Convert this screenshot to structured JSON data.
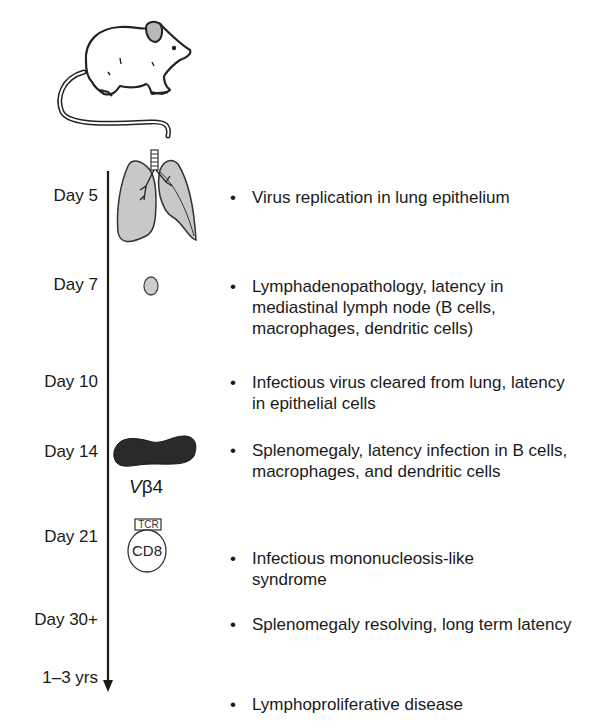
{
  "figure": {
    "timeline": {
      "days": [
        {
          "label": "Day 5",
          "description": "Virus replication in lung epithelium",
          "icon": "lungs-icon"
        },
        {
          "label": "Day 7",
          "description": "Lymphadenopathology, latency in mediastinal lymph node (B cells, macrophages, dendritic cells)",
          "icon": "lymph-node-icon"
        },
        {
          "label": "Day 10",
          "description": "Infectious virus cleared from lung, latency in epithelial cells",
          "icon": null
        },
        {
          "label": "Day 14",
          "description": "Splenomegaly, latency infection in B cells, macrophages, and dendritic cells",
          "icon": "spleen-icon"
        },
        {
          "label": "Day 21",
          "description": "Infectious mononucleosis-like syndrome",
          "icon": "cd8-t-cell-icon"
        },
        {
          "label": "Day 30+",
          "description": "Splenomegaly resolving, long term latency",
          "icon": null
        },
        {
          "label": "1–3 yrs",
          "description": "Lymphoproliferative disease",
          "icon": null
        }
      ]
    },
    "cell_labels": {
      "vbeta_v": "V",
      "vbeta_rest": "β4",
      "tcr": "TCR",
      "cd8": "CD8"
    },
    "bullet": "•",
    "colors": {
      "lung_fill": "#c8c8c8",
      "lymph_node_fill": "#cccccc",
      "spleen_fill": "#2a2a2a",
      "line": "#1a1a1a"
    }
  }
}
